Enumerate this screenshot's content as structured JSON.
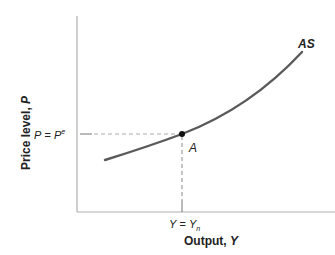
{
  "diagram": {
    "y_axis_label": "Price level, ",
    "y_axis_var": "P",
    "x_axis_label": "Output, ",
    "x_axis_var": "Y",
    "curve_label": "AS",
    "point_label": "A",
    "p_tick": {
      "lhs": "P",
      "eq": " = ",
      "rhs": "P",
      "sup": "e"
    },
    "y_tick": {
      "lhs": "Y",
      "eq": " = ",
      "rhs": "Y",
      "sub": "n"
    },
    "colors": {
      "curve": "#555555",
      "axis": "#aaaaaa",
      "dash": "#aaaaaa",
      "point": "#111111"
    }
  }
}
